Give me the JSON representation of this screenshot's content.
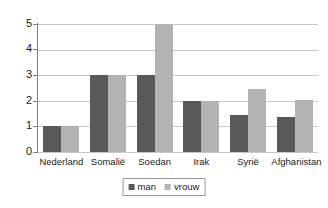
{
  "chart_data": {
    "type": "bar",
    "title": "",
    "subtitle": "",
    "xlabel": "",
    "ylabel": "",
    "categories": [
      "Nederland",
      "Somalië",
      "Soedan",
      "Irak",
      "Syrië",
      "Afghanistan"
    ],
    "series": [
      {
        "name": "man",
        "color": "#595959",
        "values": [
          1,
          3,
          3,
          2,
          1.45,
          1.35
        ]
      },
      {
        "name": "vrouw",
        "color": "#b3b3b3",
        "values": [
          1,
          3,
          5,
          2,
          2.45,
          2.05
        ]
      }
    ],
    "ylim": [
      0,
      5
    ],
    "ytick_labels": [
      "5",
      "4",
      "3",
      "2",
      "1",
      "0"
    ],
    "ytick_values": [
      5,
      4,
      3,
      2,
      1,
      0
    ],
    "grid": true,
    "grid_axis": "y",
    "legend": {
      "position": "bottom-center",
      "bordered": true
    },
    "colors": {
      "gridline": "#c8c8c8",
      "axis": "#808080",
      "background": "#ffffff",
      "text": "#1a1a1a",
      "legend_border": "#9a9a9a"
    }
  }
}
